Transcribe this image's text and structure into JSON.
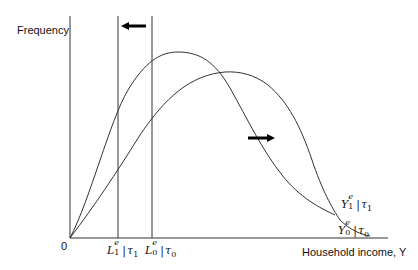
{
  "diagram": {
    "y_axis_label": "Frequency",
    "x_axis_label": "Household income, Y",
    "origin_label": "0",
    "vertical_lines": [
      {
        "id": "L1",
        "base": "L",
        "sup": "e",
        "sub": "1",
        "cond": "τ",
        "cond_sub": "1",
        "x": 118
      },
      {
        "id": "L0",
        "base": "L",
        "sup": "e",
        "sub": "0",
        "cond": "τ",
        "cond_sub": "0",
        "x": 152
      }
    ],
    "curves": [
      {
        "id": "Y1",
        "base": "Y",
        "sup": "e",
        "sub": "1",
        "cond": "τ",
        "cond_sub": "1",
        "description": "shifted-left income distribution (higher peak, earlier)"
      },
      {
        "id": "Y0",
        "base": "Y",
        "sup": "e",
        "sub": "0",
        "cond": "τ",
        "cond_sub": "0",
        "description": "baseline income distribution"
      }
    ],
    "arrows": [
      {
        "id": "left-arrow",
        "direction": "left",
        "meaning": "shift of L threshold"
      },
      {
        "id": "right-arrow",
        "direction": "right",
        "meaning": "shift between distributions"
      }
    ],
    "colors": {
      "line": "#333333",
      "arrow": "#000000",
      "text": "#111111"
    }
  }
}
